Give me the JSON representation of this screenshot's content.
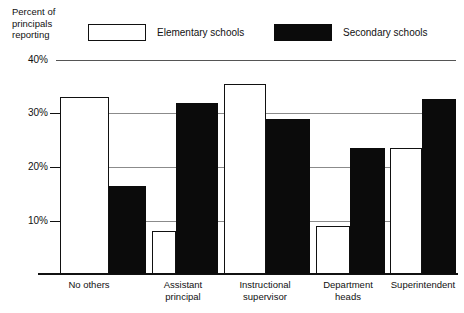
{
  "axis_title": "Percent of\nprincipals\nreporting",
  "legend": [
    {
      "key": "elementary",
      "label": "Elementary schools",
      "style": "open",
      "color": "#ffffff"
    },
    {
      "key": "secondary",
      "label": "Secondary schools",
      "style": "filled",
      "color": "#0b0b0b"
    }
  ],
  "y_ticks": [
    {
      "label": "40%",
      "value": 40
    },
    {
      "label": "30%",
      "value": 30
    },
    {
      "label": "20%",
      "value": 20
    },
    {
      "label": "10%",
      "value": 10
    }
  ],
  "chart_data": {
    "type": "bar",
    "title": "",
    "xlabel": "",
    "ylabel": "Percent of principals reporting",
    "ylim": [
      0,
      40
    ],
    "grid": true,
    "legend_position": "top",
    "categories": [
      "No others",
      "Assistant\nprincipal",
      "Instructional\nsupervisor",
      "Department\nheads",
      "Superintendent"
    ],
    "series": [
      {
        "name": "Elementary schools",
        "color": "#ffffff",
        "values": [
          33.0,
          8.0,
          35.5,
          9.0,
          23.5
        ]
      },
      {
        "name": "Secondary schools",
        "color": "#0b0b0b",
        "values": [
          16.5,
          32.0,
          29.0,
          23.5,
          32.7
        ]
      }
    ],
    "tick_labels": [
      "40%",
      "30%",
      "20%",
      "10%"
    ]
  }
}
